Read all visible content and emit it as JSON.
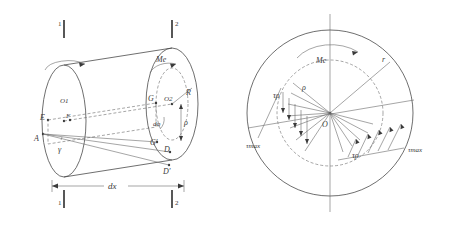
{
  "figure": {
    "stroke_color": "#4a4a4a",
    "label_color": "#3a3a3a",
    "background": "#ffffff",
    "left_diagram": {
      "name": "shaft-element",
      "section_marks": {
        "top_left": "1",
        "top_right": "2",
        "bottom_left": "1",
        "bottom_right": "2"
      },
      "labels": {
        "moment": "Me",
        "radius": "R",
        "rho": "ρ",
        "center_left": "O1",
        "center_right": "O2",
        "point_a": "A",
        "point_e": "E",
        "point_f": "F",
        "point_g": "G",
        "point_d": "D",
        "point_g_prime": "G′",
        "point_d_prime": "D′",
        "angle_gamma": "γ",
        "angle_phi": "dφ",
        "length": "dx"
      }
    },
    "right_diagram": {
      "name": "cross-section",
      "labels": {
        "moment": "Me",
        "radius": "r",
        "rho": "ρ",
        "center": "O",
        "tau_rho_left": "τρ",
        "tau_rho_right": "τρ",
        "tau_max_left": "τmax",
        "tau_max_right": "τmax"
      }
    }
  }
}
